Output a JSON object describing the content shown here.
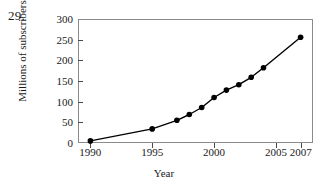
{
  "problem_number": "29.",
  "chart_data": {
    "type": "line",
    "title": "",
    "xlabel": "Year",
    "ylabel": "Millions of subscribers",
    "x": [
      1990,
      1995,
      1997,
      1998,
      1999,
      2000,
      2001,
      2002,
      2003,
      2004,
      2007
    ],
    "values": [
      5,
      34,
      55,
      69,
      86,
      110,
      128,
      141,
      159,
      182,
      256
    ],
    "series": [
      {
        "name": "Millions of subscribers",
        "values": [
          5,
          34,
          55,
          69,
          86,
          110,
          128,
          141,
          159,
          182,
          256
        ]
      }
    ],
    "xlim": [
      1989,
      2008
    ],
    "ylim": [
      0,
      300
    ],
    "xticks": [
      1990,
      1995,
      2000,
      2005,
      2007
    ],
    "xtick_labels": [
      "1990",
      "1995",
      "2000",
      "2005",
      "2007"
    ],
    "yticks": [
      0,
      50,
      100,
      150,
      200,
      250,
      300
    ],
    "ytick_labels": [
      "0",
      "50",
      "100",
      "150",
      "200",
      "250",
      "300"
    ],
    "grid": false,
    "legend": false,
    "marker": "filled-circle",
    "line_color": "#000000",
    "marker_color": "#000000",
    "frame_color": "#8a8a8a"
  }
}
